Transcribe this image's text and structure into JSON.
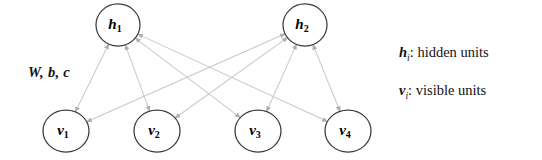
{
  "diagram": {
    "background_color": "#ffffff",
    "edge_color": "#c9c9c9",
    "node_stroke_color": "#3a3a3a",
    "node_fill_color": "#ffffff",
    "text_color": "#111111",
    "arrow_color": "#b0b0b0"
  },
  "parameters": {
    "label": "W, b, c"
  },
  "hidden_units": [
    {
      "id": "h1",
      "base": "h",
      "sub": "1",
      "cx": 118,
      "cy": 25,
      "rx": 22,
      "ry": 21
    },
    {
      "id": "h2",
      "base": "h",
      "sub": "2",
      "cx": 305,
      "cy": 25,
      "rx": 22,
      "ry": 21
    }
  ],
  "visible_units": [
    {
      "id": "v1",
      "base": "v",
      "sub": "1",
      "cx": 66,
      "cy": 131,
      "rx": 23,
      "ry": 21
    },
    {
      "id": "v2",
      "base": "v",
      "sub": "2",
      "cx": 157,
      "cy": 131,
      "rx": 23,
      "ry": 21
    },
    {
      "id": "v3",
      "base": "v",
      "sub": "3",
      "cx": 258,
      "cy": 131,
      "rx": 23,
      "ry": 21
    },
    {
      "id": "v4",
      "base": "v",
      "sub": "4",
      "cx": 348,
      "cy": 131,
      "rx": 23,
      "ry": 21
    }
  ],
  "edges": [
    {
      "from": "h1",
      "to": "v1"
    },
    {
      "from": "h1",
      "to": "v2"
    },
    {
      "from": "h1",
      "to": "v3"
    },
    {
      "from": "h1",
      "to": "v4"
    },
    {
      "from": "h2",
      "to": "v1"
    },
    {
      "from": "h2",
      "to": "v2"
    },
    {
      "from": "h2",
      "to": "v3"
    },
    {
      "from": "h2",
      "to": "v4"
    }
  ],
  "legend": {
    "hidden": {
      "symbol_base": "h",
      "symbol_sub": "i",
      "separator": ": ",
      "description": "hidden units",
      "full_text": "hᵢ: hidden units"
    },
    "visible": {
      "symbol_base": "v",
      "symbol_sub": "i",
      "separator": ": ",
      "description": "visible units",
      "full_text": "vᵢ: visible units"
    }
  }
}
